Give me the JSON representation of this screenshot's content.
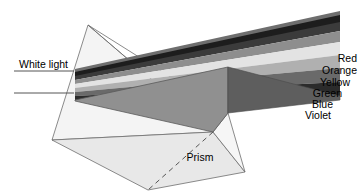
{
  "figure": {
    "type": "optics-diagram",
    "background_color": "#ffffff",
    "width": 359,
    "height": 192
  },
  "labels": {
    "white_light": "White light",
    "prism": "Prism"
  },
  "spectrum": {
    "bands": [
      {
        "name": "Red",
        "label": "Red",
        "shade": "#3b3b3b"
      },
      {
        "name": "Orange",
        "label": "Orange",
        "shade": "#8e8e8e"
      },
      {
        "name": "Yellow",
        "label": "Yellow",
        "shade": "#e3e3e3"
      },
      {
        "name": "Green",
        "label": "Green",
        "shade": "#b0b0b0"
      },
      {
        "name": "Blue",
        "label": "Blue",
        "shade": "#6a6a6a"
      },
      {
        "name": "Violet",
        "label": "Violet",
        "shade": "#2b2b2b"
      }
    ]
  },
  "prism_faces": {
    "front_face_shade": "#8f8f8f",
    "base_face_shade": "#e6e6e6",
    "left_face_shade": "#f2f2f2",
    "top_edge_shade": "#1f1f1f",
    "outline_color": "#4a4a4a"
  },
  "rays": {
    "incoming_color": "#555555",
    "count": 2
  }
}
